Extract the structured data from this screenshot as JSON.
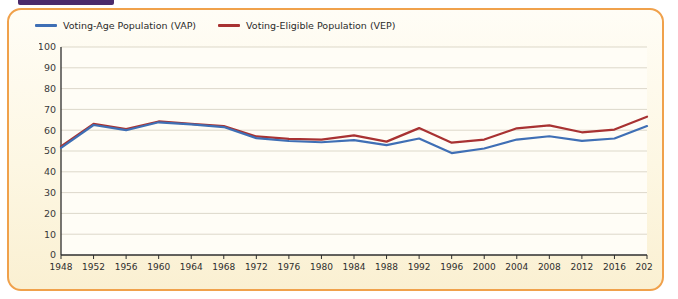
{
  "tab": {
    "label": "CHAPTER"
  },
  "heading_sliver": {
    "text": ""
  },
  "colors": {
    "vap": "#3f6fb5",
    "vep": "#a83232",
    "border": "#f0a14b",
    "plot_bg": "#fffdf6",
    "grid": "#cfc9b8",
    "axis": "#2e2e2e",
    "tab": "#4b2a6b"
  },
  "legend": {
    "position": "top-left",
    "items": [
      {
        "label": "Voting-Age Population (VAP)",
        "color": "#3f6fb5",
        "key": "vap"
      },
      {
        "label": "Voting-Eligible Population (VEP)",
        "color": "#a83232",
        "key": "vep"
      }
    ]
  },
  "chart_data": {
    "type": "line",
    "title": "",
    "subtitle": "",
    "xlabel": "",
    "ylabel": "",
    "xlim": [
      1948,
      2020
    ],
    "ylim": [
      0,
      100
    ],
    "ytick_step": 10,
    "grid": true,
    "legend_position": "top-left",
    "categories": [
      1948,
      1952,
      1956,
      1960,
      1964,
      1968,
      1972,
      1976,
      1980,
      1984,
      1988,
      1992,
      1996,
      2000,
      2004,
      2008,
      2012,
      2016,
      2020
    ],
    "x": [
      1948,
      1952,
      1956,
      1960,
      1964,
      1968,
      1972,
      1976,
      1980,
      1984,
      1988,
      1992,
      1996,
      2000,
      2004,
      2008,
      2012,
      2016,
      2020
    ],
    "ytick_labels": [
      "0",
      "10",
      "20",
      "30",
      "40",
      "50",
      "60",
      "70",
      "80",
      "90",
      "100"
    ],
    "xtick_labels": [
      "1948",
      "1952",
      "1956",
      "1960",
      "1964",
      "1968",
      "1972",
      "1976",
      "1980",
      "1984",
      "1988",
      "1992",
      "1996",
      "2000",
      "2004",
      "2008",
      "2012",
      "2016",
      "2020"
    ],
    "series": [
      {
        "name": "Voting-Age Population (VAP)",
        "key": "vap",
        "color": "#3f6fb5",
        "values": [
          51.5,
          62.5,
          60.0,
          63.8,
          62.8,
          61.5,
          56.2,
          54.8,
          54.2,
          55.2,
          52.8,
          56.0,
          49.0,
          51.2,
          55.5,
          57.1,
          54.9,
          56.0,
          62.0
        ]
      },
      {
        "name": "Voting-Eligible Population (VEP)",
        "key": "vep",
        "color": "#a83232",
        "values": [
          52.2,
          63.0,
          60.5,
          64.2,
          63.0,
          62.0,
          57.0,
          55.8,
          55.5,
          57.5,
          54.5,
          61.0,
          54.0,
          55.5,
          60.9,
          62.3,
          59.0,
          60.3,
          66.5
        ]
      }
    ]
  }
}
